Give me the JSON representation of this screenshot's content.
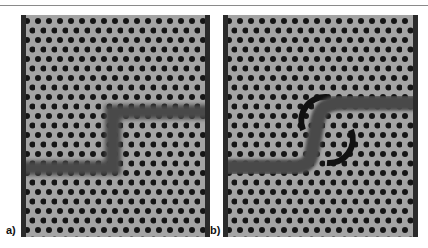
{
  "figure": {
    "panels": [
      {
        "label": "a)",
        "description": "Photonic crystal waveguide with sharp Z-bend (straight segments with two 90-degree corners)"
      },
      {
        "label": "b)",
        "description": "Photonic crystal waveguide with smooth S-bend and modified holes around the bend"
      }
    ]
  },
  "colors": {
    "background": "#9a9a9a",
    "holes": "#151515",
    "waveguide": "#4a4a4a",
    "edge_bars": "#2a2a2a"
  }
}
